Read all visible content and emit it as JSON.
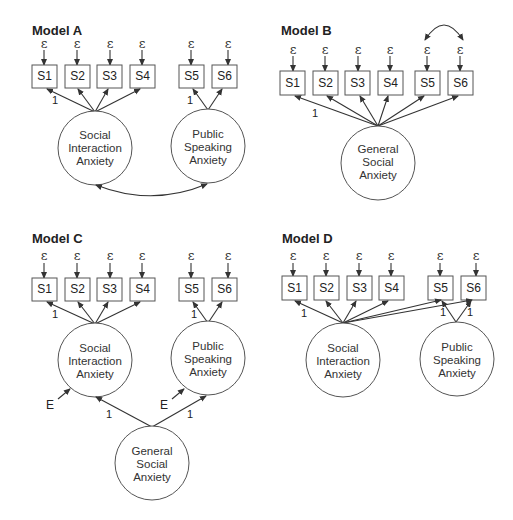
{
  "figure": {
    "error_symbol": "ε",
    "disturbance_symbol": "E",
    "loading_fixed": "1",
    "indicators": [
      "S1",
      "S2",
      "S3",
      "S4",
      "S5",
      "S6"
    ],
    "latents": {
      "sia": [
        "Social",
        "Interaction",
        "Anxiety"
      ],
      "psa": [
        "Public",
        "Speaking",
        "Anxiety"
      ],
      "gsa": [
        "General",
        "Social",
        "Anxiety"
      ]
    }
  },
  "models": [
    {
      "title": "Model A",
      "description": "Two correlated factors: Social Interaction Anxiety (S1-S4) and Public Speaking Anxiety (S5-S6)"
    },
    {
      "title": "Model B",
      "description": "Single General Social Anxiety factor (S1-S6) with correlated errors for S5 and S6"
    },
    {
      "title": "Model C",
      "description": "Second-order General Social Anxiety factor loading on Social Interaction Anxiety and Public Speaking Anxiety"
    },
    {
      "title": "Model D",
      "description": "Social Interaction Anxiety loads on S1-S6; Public Speaking Anxiety loads on S5-S6"
    }
  ]
}
